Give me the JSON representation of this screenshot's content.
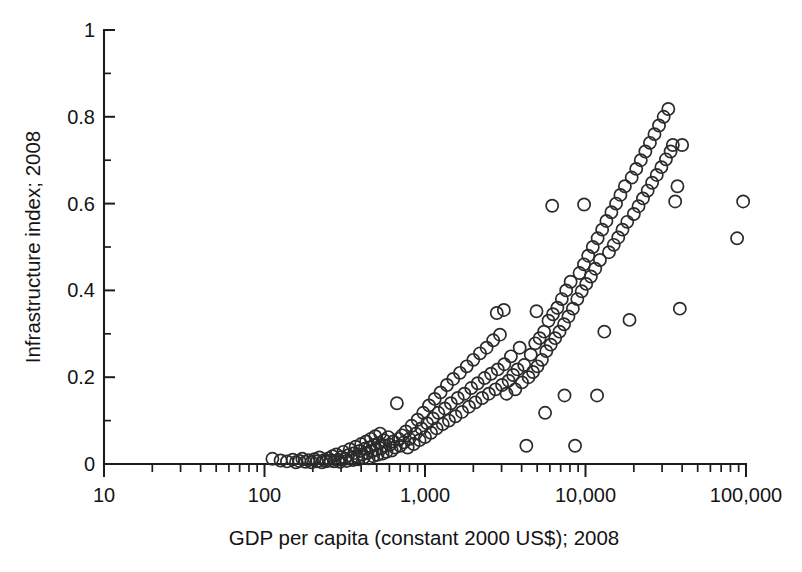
{
  "chart_data": {
    "type": "scatter",
    "title": "",
    "xlabel": "GDP per capita (constant 2000 US$); 2008",
    "ylabel": "Infrastructure index; 2008",
    "xscale": "log",
    "yscale": "linear",
    "xlim": [
      10,
      100000
    ],
    "ylim": [
      0,
      1
    ],
    "grid": false,
    "legend": null,
    "marker_style": "open-circle",
    "x_tick_labels": [
      "10",
      "100",
      "1,000",
      "10,000",
      "100,000"
    ],
    "x_tick_values": [
      10,
      100,
      1000,
      10000,
      100000
    ],
    "y_tick_labels": [
      "0",
      "0.2",
      "0.4",
      "0.6",
      "0.8",
      "1"
    ],
    "y_tick_values": [
      0,
      0.2,
      0.4,
      0.6,
      0.8,
      1
    ],
    "y_minor_tick_values": [
      0.1,
      0.3,
      0.5,
      0.7,
      0.9
    ],
    "x_minor_ticks": "log decade subdivisions 2-9",
    "n_points": 196,
    "series": [
      {
        "name": "countries",
        "points": [
          [
            112,
            0.012
          ],
          [
            126,
            0.008
          ],
          [
            138,
            0.006
          ],
          [
            150,
            0.01
          ],
          [
            157,
            0.004
          ],
          [
            165,
            0.007
          ],
          [
            172,
            0.012
          ],
          [
            180,
            0.005
          ],
          [
            188,
            0.009
          ],
          [
            196,
            0.004
          ],
          [
            205,
            0.011
          ],
          [
            212,
            0.006
          ],
          [
            220,
            0.015
          ],
          [
            228,
            0.004
          ],
          [
            235,
            0.009
          ],
          [
            242,
            0.006
          ],
          [
            250,
            0.013
          ],
          [
            258,
            0.008
          ],
          [
            265,
            0.018
          ],
          [
            272,
            0.006
          ],
          [
            280,
            0.022
          ],
          [
            288,
            0.01
          ],
          [
            295,
            0.005
          ],
          [
            302,
            0.016
          ],
          [
            310,
            0.028
          ],
          [
            318,
            0.012
          ],
          [
            325,
            0.007
          ],
          [
            332,
            0.02
          ],
          [
            340,
            0.034
          ],
          [
            348,
            0.014
          ],
          [
            355,
            0.009
          ],
          [
            362,
            0.025
          ],
          [
            370,
            0.04
          ],
          [
            378,
            0.018
          ],
          [
            385,
            0.011
          ],
          [
            392,
            0.03
          ],
          [
            400,
            0.046
          ],
          [
            408,
            0.022
          ],
          [
            415,
            0.015
          ],
          [
            422,
            0.035
          ],
          [
            430,
            0.052
          ],
          [
            438,
            0.026
          ],
          [
            445,
            0.013
          ],
          [
            452,
            0.038
          ],
          [
            460,
            0.058
          ],
          [
            468,
            0.03
          ],
          [
            475,
            0.018
          ],
          [
            482,
            0.044
          ],
          [
            490,
            0.064
          ],
          [
            498,
            0.033
          ],
          [
            505,
            0.021
          ],
          [
            515,
            0.048
          ],
          [
            525,
            0.07
          ],
          [
            535,
            0.036
          ],
          [
            545,
            0.024
          ],
          [
            555,
            0.055
          ],
          [
            565,
            0.042
          ],
          [
            575,
            0.028
          ],
          [
            590,
            0.062
          ],
          [
            605,
            0.045
          ],
          [
            620,
            0.031
          ],
          [
            635,
            0.052
          ],
          [
            650,
            0.038
          ],
          [
            668,
            0.14
          ],
          [
            685,
            0.058
          ],
          [
            700,
            0.042
          ],
          [
            720,
            0.066
          ],
          [
            740,
            0.05
          ],
          [
            760,
            0.075
          ],
          [
            780,
            0.038
          ],
          [
            800,
            0.058
          ],
          [
            825,
            0.088
          ],
          [
            850,
            0.046
          ],
          [
            875,
            0.07
          ],
          [
            900,
            0.102
          ],
          [
            925,
            0.055
          ],
          [
            950,
            0.082
          ],
          [
            975,
            0.118
          ],
          [
            1000,
            0.062
          ],
          [
            1030,
            0.094
          ],
          [
            1060,
            0.135
          ],
          [
            1090,
            0.072
          ],
          [
            1120,
            0.105
          ],
          [
            1150,
            0.15
          ],
          [
            1180,
            0.082
          ],
          [
            1210,
            0.118
          ],
          [
            1250,
            0.165
          ],
          [
            1290,
            0.092
          ],
          [
            1330,
            0.128
          ],
          [
            1370,
            0.182
          ],
          [
            1410,
            0.1
          ],
          [
            1450,
            0.14
          ],
          [
            1500,
            0.196
          ],
          [
            1550,
            0.11
          ],
          [
            1600,
            0.152
          ],
          [
            1650,
            0.21
          ],
          [
            1700,
            0.12
          ],
          [
            1760,
            0.162
          ],
          [
            1820,
            0.225
          ],
          [
            1880,
            0.132
          ],
          [
            1940,
            0.175
          ],
          [
            2000,
            0.24
          ],
          [
            2060,
            0.142
          ],
          [
            2130,
            0.186
          ],
          [
            2200,
            0.255
          ],
          [
            2270,
            0.152
          ],
          [
            2350,
            0.198
          ],
          [
            2420,
            0.268
          ],
          [
            2500,
            0.162
          ],
          [
            2580,
            0.208
          ],
          [
            2660,
            0.285
          ],
          [
            2750,
            0.172
          ],
          [
            2840,
            0.218
          ],
          [
            2930,
            0.298
          ],
          [
            3020,
            0.182
          ],
          [
            3120,
            0.23
          ],
          [
            3220,
            0.162
          ],
          [
            3320,
            0.192
          ],
          [
            3430,
            0.248
          ],
          [
            3540,
            0.205
          ],
          [
            3650,
            0.172
          ],
          [
            3770,
            0.218
          ],
          [
            3890,
            0.268
          ],
          [
            4020,
            0.188
          ],
          [
            4150,
            0.228
          ],
          [
            4280,
            0.042
          ],
          [
            4420,
            0.2
          ],
          [
            4560,
            0.252
          ],
          [
            4710,
            0.212
          ],
          [
            4860,
            0.278
          ],
          [
            5020,
            0.225
          ],
          [
            5180,
            0.29
          ],
          [
            5350,
            0.24
          ],
          [
            5520,
            0.305
          ],
          [
            5700,
            0.26
          ],
          [
            5880,
            0.33
          ],
          [
            6070,
            0.275
          ],
          [
            6270,
            0.345
          ],
          [
            6470,
            0.29
          ],
          [
            6680,
            0.36
          ],
          [
            6890,
            0.305
          ],
          [
            7120,
            0.38
          ],
          [
            7350,
            0.322
          ],
          [
            7580,
            0.4
          ],
          [
            7830,
            0.34
          ],
          [
            8080,
            0.42
          ],
          [
            8340,
            0.358
          ],
          [
            8610,
            0.042
          ],
          [
            8890,
            0.38
          ],
          [
            9180,
            0.44
          ],
          [
            9470,
            0.398
          ],
          [
            9780,
            0.46
          ],
          [
            10100,
            0.415
          ],
          [
            10400,
            0.48
          ],
          [
            10800,
            0.432
          ],
          [
            11100,
            0.5
          ],
          [
            11500,
            0.45
          ],
          [
            11900,
            0.52
          ],
          [
            12300,
            0.47
          ],
          [
            12700,
            0.54
          ],
          [
            13100,
            0.305
          ],
          [
            13500,
            0.56
          ],
          [
            14000,
            0.488
          ],
          [
            14500,
            0.58
          ],
          [
            15000,
            0.505
          ],
          [
            15500,
            0.6
          ],
          [
            16000,
            0.522
          ],
          [
            16500,
            0.62
          ],
          [
            17000,
            0.54
          ],
          [
            17600,
            0.64
          ],
          [
            18200,
            0.558
          ],
          [
            18800,
            0.332
          ],
          [
            19400,
            0.66
          ],
          [
            20000,
            0.576
          ],
          [
            20700,
            0.68
          ],
          [
            21400,
            0.594
          ],
          [
            22100,
            0.7
          ],
          [
            22800,
            0.612
          ],
          [
            23600,
            0.72
          ],
          [
            24400,
            0.63
          ],
          [
            25200,
            0.74
          ],
          [
            26000,
            0.648
          ],
          [
            26900,
            0.76
          ],
          [
            27800,
            0.666
          ],
          [
            28700,
            0.78
          ],
          [
            29700,
            0.684
          ],
          [
            30700,
            0.8
          ],
          [
            31700,
            0.702
          ],
          [
            32800,
            0.818
          ],
          [
            33900,
            0.72
          ],
          [
            35000,
            0.735
          ],
          [
            36200,
            0.605
          ],
          [
            37400,
            0.64
          ],
          [
            38700,
            0.358
          ],
          [
            40000,
            0.735
          ],
          [
            6200,
            0.595
          ],
          [
            9800,
            0.598
          ],
          [
            3100,
            0.355
          ],
          [
            4950,
            0.352
          ],
          [
            2800,
            0.348
          ],
          [
            96000,
            0.605
          ],
          [
            88000,
            0.52
          ],
          [
            7400,
            0.158
          ],
          [
            5600,
            0.118
          ],
          [
            11800,
            0.158
          ]
        ]
      }
    ]
  },
  "axes": {
    "x_title": "GDP per capita (constant 2000 US$); 2008",
    "y_title": "Infrastructure index; 2008"
  }
}
